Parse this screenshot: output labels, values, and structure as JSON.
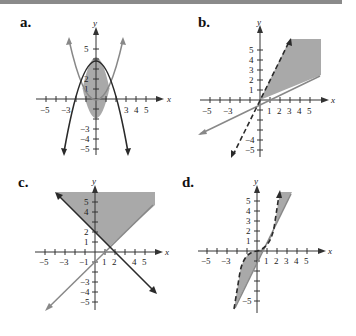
{
  "header": {
    "bar_color": "#8a8a8a"
  },
  "colors": {
    "shade": "#a9a9a9",
    "dark_curve": "#2a2a2a",
    "light_curve": "#888888",
    "axis": "#333333"
  },
  "axis_labels": {
    "x": "x",
    "y": "y"
  },
  "panels": [
    {
      "label": "a.",
      "x_ticks": [
        "−5",
        "−3",
        "3",
        "4",
        "5"
      ],
      "y_ticks": [
        "5",
        "2",
        "1",
        "−3",
        "−4",
        "−5"
      ],
      "description": "Region bounded between downward parabola (dark, solid, vertex (0,4)) and upward parabola (light, solid, vertex (0,-2)); shaded lens between them"
    },
    {
      "label": "b.",
      "x_ticks": [
        "−5",
        "−3",
        "1",
        "2",
        "3",
        "4",
        "5"
      ],
      "y_ticks": [
        "5",
        "4",
        "3",
        "2",
        "1",
        "−4",
        "−5"
      ],
      "description": "Shaded region below dashed line y=2x and above solid line y=0.4x, for x>0"
    },
    {
      "label": "c.",
      "x_ticks": [
        "−5",
        "−3",
        "−1",
        "1",
        "2",
        "4",
        "5"
      ],
      "y_ticks": [
        "5",
        "4",
        "2",
        "1",
        "−3",
        "−4",
        "−5"
      ],
      "description": "Shaded region above dark line y=-x+2 and above light line y=x-1"
    },
    {
      "label": "d.",
      "x_ticks": [
        "−5",
        "−3",
        "1",
        "2",
        "3",
        "4",
        "5"
      ],
      "y_ticks": [
        "5",
        "4",
        "3",
        "2",
        "1",
        "−5"
      ],
      "description": "Shaded region between dashed cubic-like curve y=x^3 and solid line y=2x"
    }
  ]
}
